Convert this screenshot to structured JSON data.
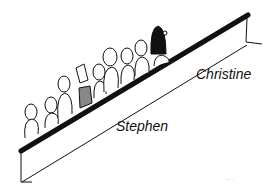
{
  "illustration": {
    "subject": "crowd of people riding an escalator",
    "labels": {
      "christine": "Christine",
      "stephen": "Stephen"
    },
    "colors": {
      "ink": "#111111",
      "background": "#ffffff",
      "hatch": "#555555"
    }
  }
}
